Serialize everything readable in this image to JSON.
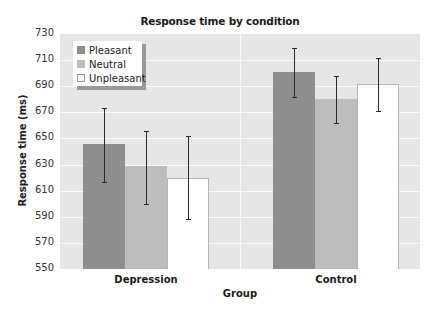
{
  "chart_data": {
    "type": "bar",
    "title": "Response time by condition",
    "xlabel": "Group",
    "ylabel": "Response time (ms)",
    "categories": [
      "Depression",
      "Control"
    ],
    "ylim": [
      550,
      730
    ],
    "yticks": [
      550,
      570,
      590,
      610,
      630,
      650,
      670,
      690,
      710,
      730
    ],
    "grid": true,
    "legend_position": "upper-left",
    "series": [
      {
        "name": "Pleasant",
        "color": "#8e8e8e",
        "values": [
          646,
          701
        ],
        "error_low": [
          617,
          682
        ],
        "error_high": [
          673,
          719
        ]
      },
      {
        "name": "Neutral",
        "color": "#bdbdbd",
        "values": [
          629,
          680
        ],
        "error_low": [
          600,
          662
        ],
        "error_high": [
          656,
          698
        ]
      },
      {
        "name": "Unpleasant",
        "color": "#ffffff",
        "values": [
          620,
          692
        ],
        "error_low": [
          588,
          671
        ],
        "error_high": [
          652,
          712
        ]
      }
    ]
  }
}
